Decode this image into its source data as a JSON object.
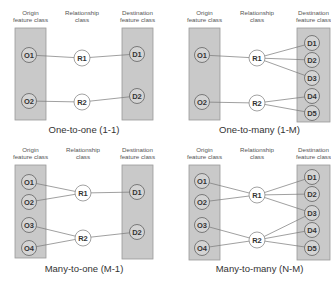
{
  "headers": {
    "origin": [
      "Origin",
      "feature class"
    ],
    "relationship": [
      "Relationship",
      "class"
    ],
    "destination": [
      "Destination",
      "feature class"
    ]
  },
  "colors": {
    "box_fill": "#c9c9c9",
    "box_stroke": "#9a9a9a",
    "class_node_fill": "#d4d4d4",
    "class_node_stroke": "#6e6e6e",
    "relationship_node_fill": "#ffffff",
    "edge": "#777777",
    "text": "#333333"
  },
  "panels": [
    {
      "id": "one-to-one",
      "title": "One-to-one (1-1)",
      "origins": [
        "O1",
        "O2"
      ],
      "relationships": [
        "R1",
        "R2"
      ],
      "destinations": [
        "D1",
        "D2"
      ],
      "links": [
        [
          "O1",
          "R1"
        ],
        [
          "R1",
          "D1"
        ],
        [
          "O2",
          "R2"
        ],
        [
          "R2",
          "D2"
        ]
      ]
    },
    {
      "id": "one-to-many",
      "title": "One-to-many (1-M)",
      "origins": [
        "O1",
        "O2"
      ],
      "relationships": [
        "R1",
        "R2"
      ],
      "destinations": [
        "D1",
        "D2",
        "D3",
        "D4",
        "D5"
      ],
      "links": [
        [
          "O1",
          "R1"
        ],
        [
          "R1",
          "D1"
        ],
        [
          "R1",
          "D2"
        ],
        [
          "R1",
          "D3"
        ],
        [
          "O2",
          "R2"
        ],
        [
          "R2",
          "D4"
        ],
        [
          "R2",
          "D5"
        ]
      ]
    },
    {
      "id": "many-to-one",
      "title": "Many-to-one (M-1)",
      "origins": [
        "O1",
        "O2",
        "O3",
        "O4"
      ],
      "relationships": [
        "R1",
        "R2"
      ],
      "destinations": [
        "D1",
        "D2"
      ],
      "links": [
        [
          "O1",
          "R1"
        ],
        [
          "O2",
          "R1"
        ],
        [
          "R1",
          "D1"
        ],
        [
          "O3",
          "R2"
        ],
        [
          "O4",
          "R2"
        ],
        [
          "R2",
          "D2"
        ]
      ]
    },
    {
      "id": "many-to-many",
      "title": "Many-to-many (N-M)",
      "origins": [
        "O1",
        "O2",
        "O3",
        "O4"
      ],
      "relationships": [
        "R1",
        "R2"
      ],
      "destinations": [
        "D1",
        "D2",
        "D3",
        "D4",
        "D5"
      ],
      "links": [
        [
          "O1",
          "R1"
        ],
        [
          "O2",
          "R1"
        ],
        [
          "R1",
          "D1"
        ],
        [
          "R1",
          "D2"
        ],
        [
          "R1",
          "D3"
        ],
        [
          "O3",
          "R2"
        ],
        [
          "O4",
          "R2"
        ],
        [
          "R2",
          "D3"
        ],
        [
          "R2",
          "D4"
        ],
        [
          "R2",
          "D5"
        ]
      ]
    }
  ]
}
